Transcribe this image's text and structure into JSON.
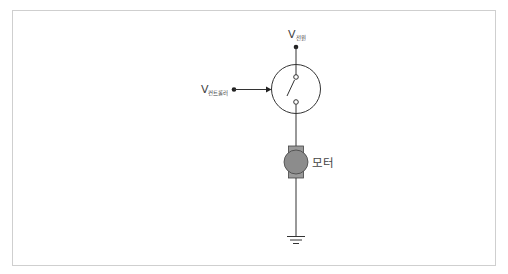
{
  "diagram": {
    "type": "circuit-schematic",
    "labels": {
      "power_supply": {
        "main": "V",
        "subscript": "전원"
      },
      "controller": {
        "main": "V",
        "subscript": "컨트롤러"
      },
      "motor": "모터"
    },
    "components": [
      "power-supply-terminal",
      "controlled-switch",
      "controller-input",
      "dc-motor",
      "ground"
    ],
    "colors": {
      "line": "#333333",
      "motor_fill": "#8c8c8c",
      "motor_cap": "#9a9a9a",
      "frame_border": "#cfcfcf"
    }
  }
}
